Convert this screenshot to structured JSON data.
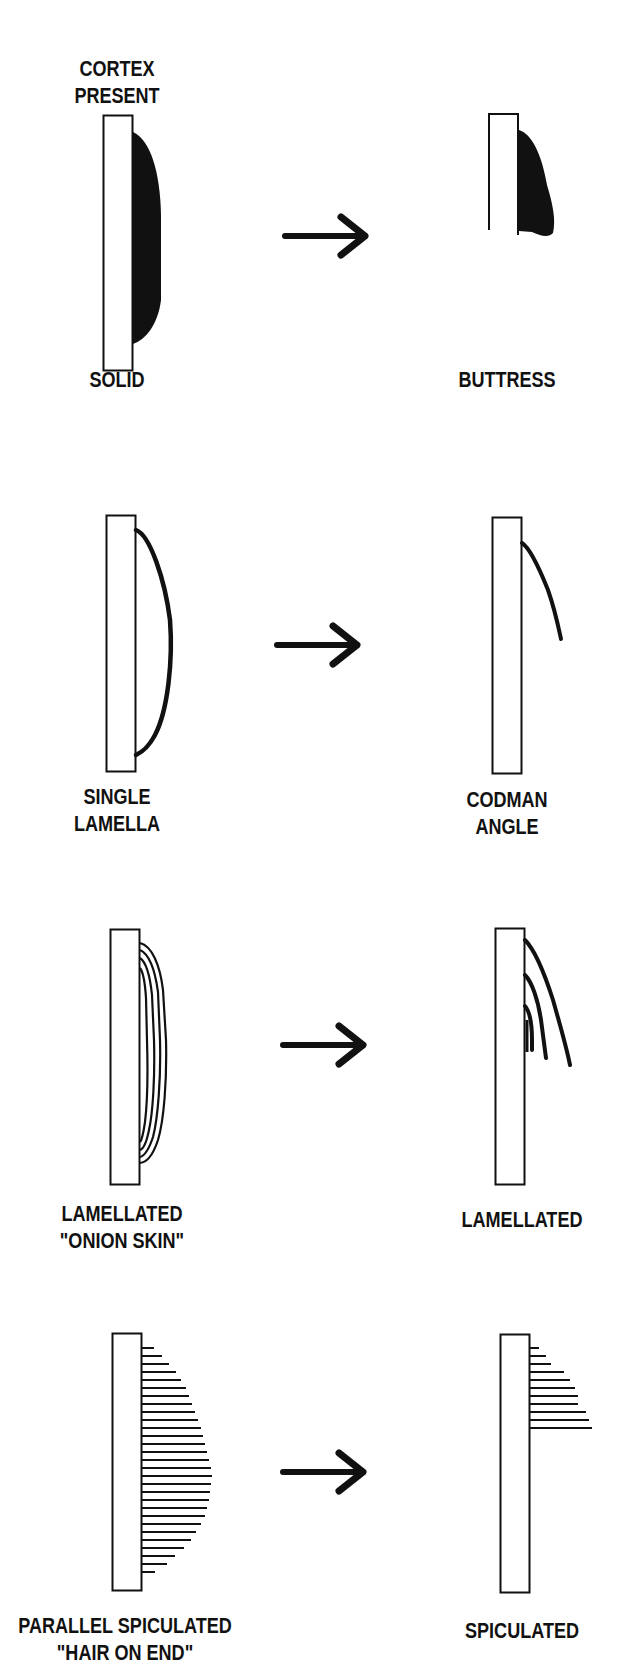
{
  "figure": {
    "colors": {
      "ink": "#111111",
      "background": "#ffffff",
      "cortex_fill": "#ffffff"
    },
    "annotations": {
      "top_label": [
        "CORTEX",
        "PRESENT"
      ]
    },
    "rows": [
      {
        "id": "solid",
        "left_label": [
          "SOLID"
        ],
        "right_label": [
          "BUTTRESS"
        ],
        "arrow": "right-arrow"
      },
      {
        "id": "single-lamella",
        "left_label": [
          "SINGLE",
          "LAMELLA"
        ],
        "right_label": [
          "CODMAN",
          "ANGLE"
        ],
        "arrow": "right-arrow"
      },
      {
        "id": "lamellated",
        "left_label": [
          "LAMELLATED",
          "\"ONION SKIN\""
        ],
        "right_label": [
          "LAMELLATED"
        ],
        "arrow": "right-arrow"
      },
      {
        "id": "spiculated",
        "left_label": [
          "PARALLEL SPICULATED",
          "\"HAIR ON END\""
        ],
        "right_label": [
          "SPICULATED"
        ],
        "arrow": "right-arrow"
      }
    ]
  }
}
